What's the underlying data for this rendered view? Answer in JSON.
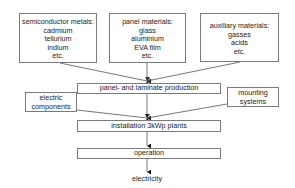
{
  "diagram": {
    "inputs": [
      {
        "title": "semiconductor metals:",
        "items": [
          "cadmium",
          "tellurium",
          "indium",
          "etc."
        ]
      },
      {
        "title": "panel materials:",
        "items": [
          "glass",
          "aluminium",
          "EVA film",
          "etc."
        ]
      },
      {
        "title": "auxiliary materials:",
        "items": [
          "gasses",
          "acids",
          "etc."
        ]
      }
    ],
    "side_inputs": {
      "electric": [
        "electric",
        "components"
      ],
      "mounting": [
        "mounting",
        "systems"
      ]
    },
    "steps": [
      "panel- and laminate production",
      "installation 3kWp plants",
      "operation"
    ],
    "output": "electricity"
  }
}
